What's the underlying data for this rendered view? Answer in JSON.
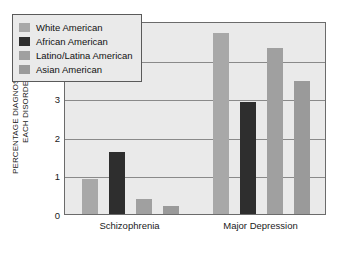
{
  "chart_data": {
    "type": "bar",
    "title": "",
    "xlabel": "",
    "ylabel_line1": "PERCENTAGE DIAGNOSED WITH",
    "ylabel_line2": "EACH DISORDER",
    "categories": [
      "Schizophrenia",
      "Major Depression"
    ],
    "ylim": [
      0,
      5
    ],
    "yticks": [
      0,
      1,
      2,
      3,
      4,
      5
    ],
    "ytick_labels": [
      "0",
      "1",
      "2",
      "3",
      "4",
      "5"
    ],
    "grid": true,
    "legend_position": "upper-left-inside",
    "series": [
      {
        "name": "White American",
        "color": "#a8a8a8",
        "values": [
          0.9,
          4.7
        ]
      },
      {
        "name": "African American",
        "color": "#2e2e2e",
        "values": [
          1.6,
          2.9
        ]
      },
      {
        "name": "Latino/Latina American",
        "color": "#a0a0a0",
        "values": [
          0.4,
          4.3
        ]
      },
      {
        "name": "Asian American",
        "color": "#9a9a9a",
        "values": [
          0.2,
          3.45
        ]
      }
    ]
  },
  "colors": {
    "plot_background": "#eaeaea",
    "frame": "#6b6b6b",
    "gridline": "#8a8a8a",
    "text": "#1a1a1a",
    "page_background": "#ffffff"
  }
}
